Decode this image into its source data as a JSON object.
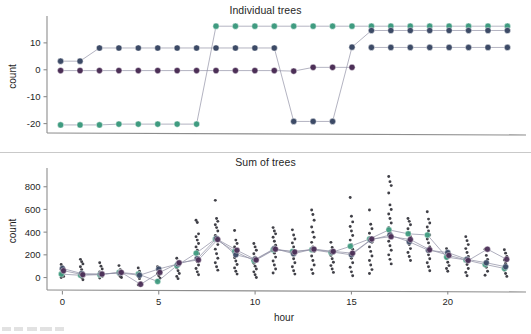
{
  "figure": {
    "background": "#ffffff",
    "series_colors": {
      "teal": "#3f9b80",
      "navy": "#3c4a66",
      "purple": "#4c2f57",
      "scatter": "#2b2b33",
      "axis": "#8d8d8d",
      "text": "#1f1f1f"
    }
  },
  "panels": {
    "top": {
      "title": "Individual trees",
      "ylabel": "count",
      "xlabel": ""
    },
    "bottom": {
      "title": "Sum of trees",
      "ylabel": "count",
      "xlabel": "hour"
    }
  },
  "chart_data": [
    {
      "type": "line",
      "title": "Individual trees",
      "xlabel": "",
      "ylabel": "count",
      "x": [
        0,
        1,
        2,
        3,
        4,
        5,
        6,
        7,
        8,
        9,
        10,
        11,
        12,
        13,
        14,
        15,
        16,
        17,
        18,
        19,
        20,
        21,
        22,
        23
      ],
      "xlim": [
        -0.7,
        23.7
      ],
      "ylim": [
        -23.5,
        18.5
      ],
      "yticks": [
        10,
        0,
        -10,
        -20
      ],
      "yticklabels": [
        "10",
        "0",
        "-10",
        "-20"
      ],
      "xticks": [],
      "xticklabels": [],
      "grid": false,
      "legend": "none",
      "series": [
        {
          "name": "tree-teal",
          "color": "#3f9b80",
          "values": [
            -20.5,
            -20.5,
            -20.5,
            -20.2,
            -20.2,
            -20.2,
            -20.2,
            -20.2,
            16.2,
            16.2,
            16.2,
            16.2,
            16.2,
            16.2,
            16.2,
            16.2,
            16.2,
            16.2,
            16.2,
            16.2,
            16.2,
            16.2,
            16.2,
            16.2
          ]
        },
        {
          "name": "tree-navy",
          "color": "#3c4a66",
          "values": [
            3.2,
            3.2,
            8.1,
            8.1,
            8.1,
            8.1,
            8.1,
            8.1,
            8.1,
            8.1,
            8.1,
            8.1,
            -19.2,
            -19.2,
            -19.2,
            8.4,
            14.6,
            14.6,
            14.6,
            14.6,
            14.6,
            14.6,
            14.6,
            14.6
          ]
        },
        {
          "name": "tree-navy-2",
          "color": "#3c4a66",
          "values": [
            null,
            null,
            null,
            null,
            null,
            null,
            null,
            null,
            null,
            null,
            null,
            null,
            null,
            null,
            null,
            null,
            8.3,
            8.3,
            8.3,
            8.3,
            8.3,
            8.3,
            8.3,
            8.3
          ]
        },
        {
          "name": "tree-purple",
          "color": "#4c2f57",
          "values": [
            -0.3,
            -0.3,
            -0.3,
            -0.3,
            -0.3,
            -0.3,
            -0.3,
            -0.3,
            -0.3,
            -0.3,
            -0.3,
            -0.3,
            -0.5,
            0.9,
            0.9,
            0.9,
            null,
            null,
            null,
            null,
            null,
            null,
            null,
            null
          ]
        }
      ]
    },
    {
      "type": "scatter",
      "title": "Sum of trees",
      "xlabel": "hour",
      "ylabel": "count",
      "xlim": [
        -0.8,
        23.8
      ],
      "ylim": [
        -110,
        930
      ],
      "xticks": [
        0,
        5,
        10,
        15,
        20
      ],
      "xticklabels": [
        "0",
        "5",
        "10",
        "15",
        "20"
      ],
      "yticks": [
        0,
        200,
        400,
        600,
        800
      ],
      "yticklabels": [
        "0",
        "200",
        "400",
        "600",
        "800"
      ],
      "grid": false,
      "legend": "none",
      "mean_series": [
        {
          "name": "sum-teal",
          "color": "#3f9b80",
          "values": [
            30,
            20,
            25,
            45,
            30,
            -35,
            105,
            215,
            340,
            230,
            150,
            245,
            230,
            245,
            220,
            275,
            340,
            420,
            385,
            375,
            180,
            155,
            115,
            80
          ]
        },
        {
          "name": "sum-navy",
          "color": "#3c4a66",
          "values": [
            80,
            35,
            30,
            40,
            20,
            75,
            120,
            165,
            345,
            200,
            160,
            255,
            210,
            250,
            225,
            200,
            330,
            375,
            315,
            240,
            220,
            160,
            130,
            95
          ]
        },
        {
          "name": "sum-purple",
          "color": "#4c2f57",
          "values": [
            60,
            25,
            30,
            45,
            -60,
            45,
            130,
            155,
            335,
            240,
            155,
            250,
            225,
            250,
            230,
            215,
            340,
            360,
            335,
            245,
            195,
            150,
            250,
            160
          ]
        }
      ],
      "scatter_points": {
        "0": [
          115,
          95,
          80,
          70,
          55,
          45,
          30,
          20,
          10,
          0
        ],
        "1": [
          160,
          140,
          120,
          95,
          70,
          45,
          20,
          0,
          -20
        ],
        "2": [
          130,
          100,
          75,
          50,
          30,
          10,
          -5
        ],
        "3": [
          105,
          70,
          45,
          25,
          10,
          0
        ],
        "4": [
          85,
          55,
          30,
          10,
          -10,
          -45,
          -65
        ],
        "5": [
          95,
          75,
          55,
          35,
          15,
          -5,
          -25
        ],
        "6": [
          170,
          135,
          110,
          85,
          60,
          35,
          10,
          -10
        ],
        "7": [
          505,
          485,
          385,
          360,
          330,
          300,
          270,
          240,
          210,
          175,
          140,
          110,
          80,
          50,
          25
        ],
        "8": [
          680,
          520,
          495,
          465,
          440,
          410,
          370,
          330,
          290,
          250,
          210,
          170,
          130,
          95,
          65
        ],
        "9": [
          415,
          330,
          300,
          270,
          240,
          205,
          175,
          145,
          115,
          85,
          55,
          30
        ],
        "10": [
          300,
          270,
          240,
          210,
          180,
          155,
          125,
          100,
          75,
          50,
          25,
          0
        ],
        "11": [
          440,
          410,
          385,
          355,
          320,
          285,
          250,
          215,
          180,
          145,
          110,
          75,
          40
        ],
        "12": [
          420,
          375,
          340,
          305,
          270,
          235,
          200,
          165,
          130,
          95,
          60,
          30
        ],
        "13": [
          595,
          555,
          505,
          445,
          400,
          355,
          310,
          270,
          230,
          190,
          150,
          110,
          70,
          35
        ],
        "14": [
          310,
          265,
          230,
          195,
          165,
          135,
          105,
          75,
          45
        ],
        "15": [
          705,
          540,
          490,
          450,
          410,
          370,
          330,
          290,
          250,
          210,
          170,
          130,
          90,
          50,
          15
        ],
        "16": [
          595,
          470,
          430,
          390,
          350,
          310,
          270,
          230,
          190,
          150,
          110,
          70,
          35
        ],
        "17": [
          890,
          845,
          810,
          745,
          640,
          600,
          560,
          520,
          480,
          440,
          400,
          360,
          320,
          280,
          240,
          200,
          160,
          120
        ],
        "18": [
          520,
          495,
          465,
          430,
          395,
          360,
          325,
          290,
          255,
          220,
          185,
          150
        ],
        "19": [
          580,
          515,
          480,
          445,
          410,
          375,
          340,
          305,
          270,
          235,
          200,
          165,
          130,
          95,
          60
        ],
        "20": [
          255,
          225,
          195,
          165,
          135,
          105,
          80,
          55
        ],
        "21": [
          360,
          325,
          290,
          255,
          220,
          185,
          150,
          115,
          80,
          45,
          15
        ],
        "22": [
          250,
          195,
          160,
          125,
          90,
          55,
          20
        ],
        "23": [
          245,
          215,
          185,
          155,
          125,
          95,
          65,
          35,
          10
        ]
      }
    }
  ]
}
